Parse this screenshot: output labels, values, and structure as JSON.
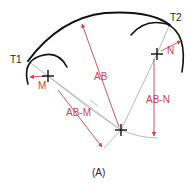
{
  "figure": {
    "caption": "(A)",
    "labels": {
      "t1": "T1",
      "t2": "T2",
      "m": "M",
      "n": "N",
      "ab": "AB",
      "ab_m": "AB-M",
      "ab_n": "AB-N"
    },
    "colors": {
      "arc": "#111111",
      "dimension": "#d0424a",
      "construction": "#a8a8a8",
      "text": "#222222"
    }
  }
}
